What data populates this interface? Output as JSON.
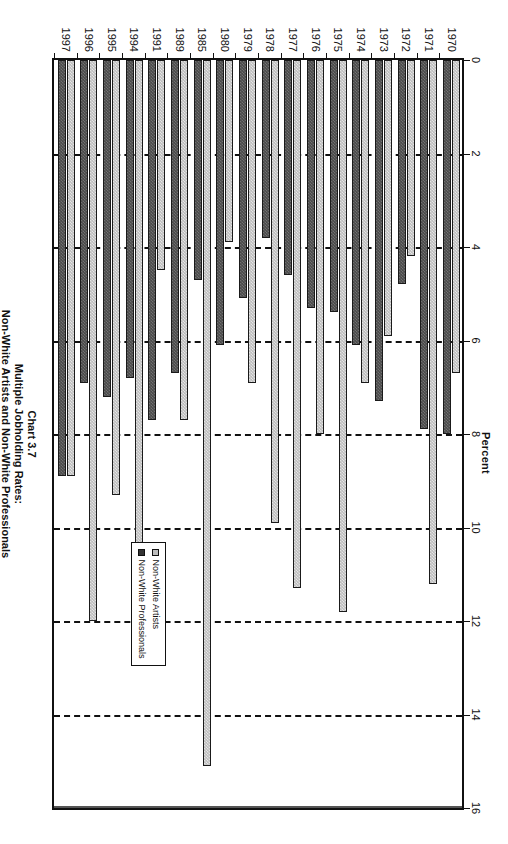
{
  "chart_data": {
    "type": "bar",
    "orientation": "horizontal",
    "title_lines": [
      "Chart 3.7",
      "Multiple Jobholding Rates:",
      "Non-White Artists and Non-White Professionals"
    ],
    "xlabel": "Percent",
    "ylabel": "",
    "xlim": [
      0,
      16
    ],
    "xticks": [
      0,
      2,
      4,
      6,
      8,
      10,
      12,
      14,
      16
    ],
    "xtick_labels": [
      "0",
      "2",
      "4",
      "6",
      "8",
      "10",
      "12",
      "14",
      "16"
    ],
    "grid": "vertical-dashed",
    "legend_position": "bottom-right-inside",
    "categories": [
      "1970",
      "1971",
      "1972",
      "1973",
      "1974",
      "1975",
      "1976",
      "1977",
      "1978",
      "1979",
      "1980",
      "1985",
      "1989",
      "1991",
      "1994",
      "1995",
      "1996",
      "1997"
    ],
    "series": [
      {
        "name": "Non-White Artists",
        "color": "#bdbdbd",
        "values": [
          6.7,
          11.2,
          4.2,
          5.9,
          6.9,
          11.8,
          8.0,
          11.3,
          9.9,
          6.9,
          3.9,
          15.1,
          7.7,
          4.5,
          10.7,
          9.3,
          12.0,
          8.9
        ]
      },
      {
        "name": "Non-White Professionals",
        "color": "#4a4a4a",
        "values": [
          8.0,
          7.9,
          4.8,
          7.3,
          6.1,
          5.4,
          5.3,
          4.6,
          3.8,
          5.1,
          6.1,
          4.7,
          6.7,
          7.7,
          6.8,
          7.2,
          6.9,
          8.9
        ]
      }
    ]
  },
  "legend": {
    "items": [
      {
        "label": "Non-White Artists",
        "swatch": "artists"
      },
      {
        "label": "Non-White Professionals",
        "swatch": "profs"
      }
    ]
  }
}
